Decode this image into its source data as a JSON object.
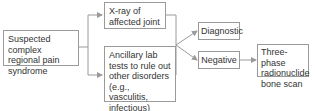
{
  "diagram": {
    "type": "flowchart",
    "nodes": {
      "start": {
        "label": "Suspected complex regional pain syndrome"
      },
      "xray": {
        "label": "X-ray of affected joint"
      },
      "labs": {
        "label": "Ancillary lab tests to rule out other disorders (e.g., vasculitis, infectious)"
      },
      "diagnostic": {
        "label": "Diagnostic"
      },
      "negative": {
        "label": "Negative"
      },
      "bonescan": {
        "label": "Three-phase radionuclide bone scan"
      }
    },
    "edges": [
      {
        "from": "start",
        "to": "xray"
      },
      {
        "from": "start",
        "to": "labs"
      },
      {
        "from": "xray",
        "to": "diagnostic"
      },
      {
        "from": "labs",
        "to": "diagnostic"
      },
      {
        "from": "xray",
        "to": "negative"
      },
      {
        "from": "labs",
        "to": "negative"
      },
      {
        "from": "negative",
        "to": "bonescan"
      }
    ],
    "colors": {
      "line": "#9a9a9a",
      "text": "#333333",
      "border": "#9a9a9a"
    }
  }
}
